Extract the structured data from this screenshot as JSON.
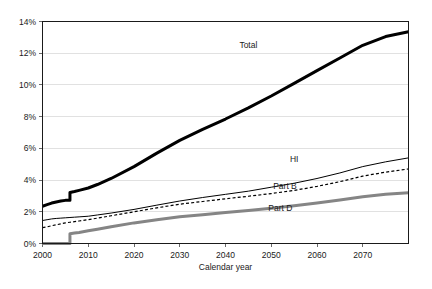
{
  "chart_data": {
    "type": "line",
    "title": "",
    "xlabel": "Calendar year",
    "ylabel": "",
    "xlim": [
      2000,
      2080
    ],
    "ylim": [
      0,
      14
    ],
    "grid": true,
    "legend_position": "inline-annotations",
    "x_ticks": [
      "2000",
      "2010",
      "2020",
      "2030",
      "2040",
      "2050",
      "2060",
      "2070"
    ],
    "x_tick_values": [
      2000,
      2010,
      2020,
      2030,
      2040,
      2050,
      2060,
      2070
    ],
    "y_ticks": [
      "0%",
      "2%",
      "4%",
      "6%",
      "8%",
      "10%",
      "12%",
      "14%"
    ],
    "y_tick_values": [
      0,
      2,
      4,
      6,
      8,
      10,
      12,
      14
    ],
    "x": [
      2000,
      2001,
      2002,
      2003,
      2004,
      2005,
      2006,
      2007,
      2008,
      2010,
      2012,
      2015,
      2020,
      2025,
      2030,
      2035,
      2040,
      2045,
      2050,
      2055,
      2060,
      2065,
      2070,
      2075,
      2080
    ],
    "series": [
      {
        "name": "Total",
        "label": "Total",
        "color": "#000000",
        "style": "solid-thick",
        "values": [
          2.35,
          2.45,
          2.55,
          2.62,
          2.68,
          2.72,
          3.22,
          3.28,
          3.35,
          3.5,
          3.72,
          4.1,
          4.85,
          5.7,
          6.5,
          7.2,
          7.85,
          8.55,
          9.3,
          10.1,
          10.9,
          11.7,
          12.5,
          13.05,
          13.35
        ]
      },
      {
        "name": "HI",
        "label": "HI",
        "color": "#000000",
        "style": "solid-thin",
        "values": [
          1.45,
          1.5,
          1.55,
          1.58,
          1.6,
          1.62,
          1.64,
          1.66,
          1.68,
          1.72,
          1.8,
          1.92,
          2.15,
          2.42,
          2.68,
          2.9,
          3.1,
          3.3,
          3.55,
          3.8,
          4.1,
          4.45,
          4.85,
          5.15,
          5.4
        ]
      },
      {
        "name": "Part B",
        "label": "Part B",
        "color": "#000000",
        "style": "dashed",
        "values": [
          1.0,
          1.05,
          1.12,
          1.18,
          1.24,
          1.3,
          1.34,
          1.38,
          1.42,
          1.5,
          1.6,
          1.75,
          2.0,
          2.25,
          2.48,
          2.65,
          2.82,
          2.98,
          3.15,
          3.35,
          3.6,
          3.9,
          4.25,
          4.5,
          4.7
        ]
      },
      {
        "name": "Part D",
        "label": "Part D",
        "color": "#858585",
        "style": "solid-thick-gray",
        "values": [
          0.0,
          0.0,
          0.0,
          0.0,
          0.0,
          0.0,
          0.62,
          0.66,
          0.7,
          0.8,
          0.9,
          1.05,
          1.3,
          1.5,
          1.68,
          1.82,
          1.95,
          2.08,
          2.22,
          2.38,
          2.55,
          2.75,
          2.95,
          3.1,
          3.2
        ]
      }
    ],
    "annotations": [
      {
        "text": "Total",
        "x": 2045,
        "y": 12.35
      },
      {
        "text": "HI",
        "x": 2055,
        "y": 5.15
      },
      {
        "text": "Part B",
        "x": 2053,
        "y": 3.45
      },
      {
        "text": "Part D",
        "x": 2052,
        "y": 2.05
      }
    ]
  },
  "colors": {
    "total": "#000000",
    "hi": "#000000",
    "part_b": "#000000",
    "part_d": "#858585",
    "gridline": "#d9d9d9",
    "axis": "#1a1a1a",
    "background": "#ffffff"
  }
}
